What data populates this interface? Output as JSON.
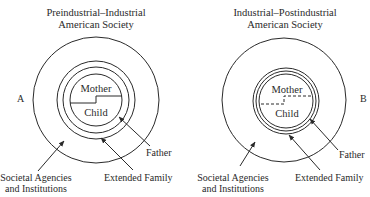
{
  "diagram_a": {
    "title_line1": "Preindustrial–Industrial",
    "title_line2": "American Society",
    "panel_label": "A",
    "inner_top": "Mother",
    "inner_bottom": "Child",
    "boundary_style": "solid",
    "labels": {
      "father": "Father",
      "extended_family": "Extended Family",
      "societal_line1": "Societal Agencies",
      "societal_line2": "and Institutions"
    }
  },
  "diagram_b": {
    "title_line1": "Industrial–Postindustrial",
    "title_line2": "American Society",
    "panel_label": "B",
    "inner_top": "Mother",
    "inner_bottom": "Child",
    "boundary_style": "dashed",
    "labels": {
      "father": "Father",
      "extended_family": "Extended Family",
      "societal_line1": "Societal Agencies",
      "societal_line2": "and Institutions"
    }
  }
}
